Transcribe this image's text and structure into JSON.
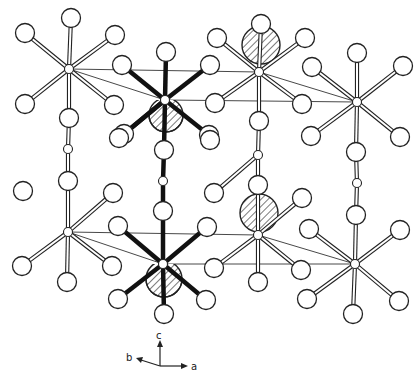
{
  "figure": {
    "type": "crystal-structure-projection",
    "axes": {
      "c_label": "c",
      "b_label": "b",
      "a_label": "a"
    },
    "colors": {
      "line": "#222222",
      "background": "#ffffff"
    },
    "columns": [
      {
        "name": "left-chain",
        "style": "open",
        "nodes": [
          [
            69,
            69
          ],
          [
            68,
            149
          ],
          [
            68,
            232
          ]
        ],
        "atoms": [
          [
            71,
            18
          ],
          [
            25,
            33
          ],
          [
            115,
            35
          ],
          [
            25,
            104
          ],
          [
            114,
            105
          ],
          [
            69,
            118
          ],
          [
            68,
            181
          ],
          [
            23,
            191
          ],
          [
            113,
            193
          ],
          [
            22,
            266
          ],
          [
            112,
            266
          ],
          [
            67,
            282
          ]
        ]
      },
      {
        "name": "middle-chain",
        "style": "bold",
        "nodes": [
          [
            165,
            100
          ],
          [
            163,
            181
          ],
          [
            163,
            264
          ]
        ],
        "atoms": [
          [
            166,
            52
          ],
          [
            122,
            65
          ],
          [
            210,
            65
          ],
          [
            124,
            134
          ],
          [
            209,
            135
          ],
          [
            164,
            150
          ],
          [
            119,
            138
          ],
          [
            210,
            140
          ],
          [
            163,
            211
          ],
          [
            118,
            226
          ],
          [
            207,
            227
          ],
          [
            118,
            299
          ],
          [
            206,
            300
          ],
          [
            164,
            314
          ]
        ]
      },
      {
        "name": "third-chain",
        "style": "open",
        "nodes": [
          [
            259,
            72
          ],
          [
            258,
            155
          ],
          [
            258,
            235
          ]
        ],
        "atoms": [
          [
            261,
            24
          ],
          [
            217,
            38
          ],
          [
            305,
            38
          ],
          [
            215,
            103
          ],
          [
            302,
            104
          ],
          [
            259,
            121
          ],
          [
            258,
            185
          ],
          [
            214,
            193
          ],
          [
            302,
            198
          ],
          [
            214,
            268
          ],
          [
            301,
            270
          ],
          [
            258,
            282
          ]
        ]
      },
      {
        "name": "right-chain",
        "style": "open",
        "nodes": [
          [
            357,
            102
          ],
          [
            357,
            183
          ],
          [
            355,
            264
          ]
        ],
        "atoms": [
          [
            357,
            53
          ],
          [
            312,
            67
          ],
          [
            403,
            66
          ],
          [
            311,
            136
          ],
          [
            400,
            137
          ],
          [
            356,
            152
          ],
          [
            356,
            215
          ],
          [
            309,
            229
          ],
          [
            400,
            230
          ],
          [
            307,
            299
          ],
          [
            399,
            301
          ],
          [
            353,
            314
          ]
        ]
      }
    ],
    "hatched_atoms": [
      {
        "cx": 261,
        "cy": 45,
        "r": 19
      },
      {
        "cx": 259,
        "cy": 213,
        "r": 19
      },
      {
        "cx": 166,
        "cy": 115,
        "r": 17,
        "partial": true
      },
      {
        "cx": 164,
        "cy": 279,
        "r": 18,
        "partial": true
      }
    ],
    "cell_lines": [
      [
        [
          69,
          69
        ],
        [
          165,
          100
        ]
      ],
      [
        [
          69,
          69
        ],
        [
          259,
          72
        ]
      ],
      [
        [
          165,
          100
        ],
        [
          357,
          102
        ]
      ],
      [
        [
          259,
          72
        ],
        [
          357,
          102
        ]
      ],
      [
        [
          68,
          232
        ],
        [
          163,
          264
        ]
      ],
      [
        [
          68,
          232
        ],
        [
          258,
          235
        ]
      ],
      [
        [
          163,
          264
        ],
        [
          355,
          264
        ]
      ],
      [
        [
          258,
          235
        ],
        [
          355,
          264
        ]
      ]
    ]
  }
}
